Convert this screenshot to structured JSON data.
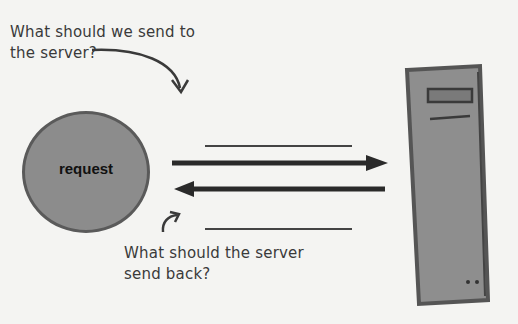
{
  "annotations": {
    "top_question": [
      "What should we send to",
      "the server?"
    ],
    "bottom_question": [
      "What should the server",
      "send back?"
    ]
  },
  "nodes": {
    "request": {
      "label": "request",
      "shape": "circle",
      "fill": "#8c8c8c"
    },
    "server": {
      "label": "",
      "shape": "server-tower",
      "fill": "#8e8e8e"
    }
  },
  "edges": [
    {
      "from": "request",
      "to": "server",
      "direction": "right",
      "blank_label_line": "above"
    },
    {
      "from": "server",
      "to": "request",
      "direction": "left",
      "blank_label_line": "below"
    }
  ],
  "colors": {
    "background": "#f4f4f2",
    "ink": "#3a3a3a",
    "shape_fill": "#8c8c8c"
  }
}
